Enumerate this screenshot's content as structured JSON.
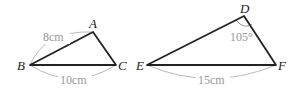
{
  "triangle1": {
    "vertices": {
      "A": "A",
      "B": "B",
      "C": "C"
    },
    "side_AB": "8cm",
    "side_BC": "10cm"
  },
  "triangle2": {
    "vertices": {
      "D": "D",
      "E": "E",
      "F": "F"
    },
    "angle_D": "105°",
    "side_EF": "15cm"
  },
  "colors": {
    "stroke": "#222222",
    "annotation": "#aaaaaa"
  }
}
